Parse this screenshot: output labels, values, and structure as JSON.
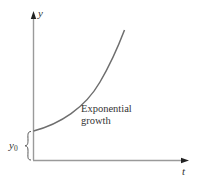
{
  "diagram": {
    "type": "exponential-growth-graph",
    "y_axis": {
      "label": "y"
    },
    "x_axis": {
      "label": "t"
    },
    "curve": {
      "label_line1": "Exponential",
      "label_line2": "growth"
    },
    "initial_value": {
      "symbol": "y",
      "subscript": "0"
    },
    "colors": {
      "axis": "#888888",
      "curve": "#6e6e6e",
      "arrow": "#222222",
      "text": "#333333"
    }
  }
}
